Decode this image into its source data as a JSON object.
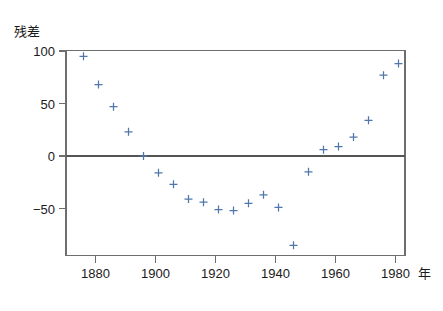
{
  "chart_data": {
    "type": "scatter",
    "title": "",
    "subtitle": "",
    "xlabel": "年",
    "ylabel": "残差",
    "xlim": [
      1875,
      1988
    ],
    "ylim": [
      -98,
      108
    ],
    "grid": false,
    "legend": null,
    "marker": "plus",
    "marker_color": "#4f77ad",
    "xticks": [
      1880,
      1900,
      1920,
      1940,
      1960,
      1980
    ],
    "xtick_labels": [
      "1880",
      "1900",
      "1920",
      "1940",
      "1960",
      "1980"
    ],
    "yticks": [
      100,
      50,
      0,
      -50
    ],
    "ytick_labels": [
      "100",
      "50",
      "0",
      "−50"
    ],
    "zero_line": 0,
    "series": [
      {
        "name": "残差",
        "x": [
          1876,
          1881,
          1886,
          1891,
          1896,
          1901,
          1906,
          1911,
          1916,
          1921,
          1926,
          1931,
          1936,
          1941,
          1946,
          1951,
          1956,
          1961,
          1966,
          1971,
          1976,
          1981
        ],
        "values": [
          95,
          68,
          47,
          23,
          0,
          -16,
          -27,
          -41,
          -44,
          -51,
          -52,
          -45,
          -37,
          -49,
          -85,
          -15,
          6,
          9,
          18,
          34,
          77,
          88
        ]
      }
    ]
  },
  "labels": {
    "y_axis_title": "残差",
    "x_axis_title": "年",
    "y_tick_100": "100",
    "y_tick_50": "50",
    "y_tick_0": "0",
    "y_tick_neg50": "−50",
    "x_tick_1880": "1880",
    "x_tick_1900": "1900",
    "x_tick_1920": "1920",
    "x_tick_1940": "1940",
    "x_tick_1960": "1960",
    "x_tick_1980": "1980"
  },
  "colors": {
    "marker": "#4f77ad",
    "axis": "#6e6e6e",
    "zero_line": "#555555",
    "background": "#ffffff",
    "text": "#1a1a1a"
  }
}
